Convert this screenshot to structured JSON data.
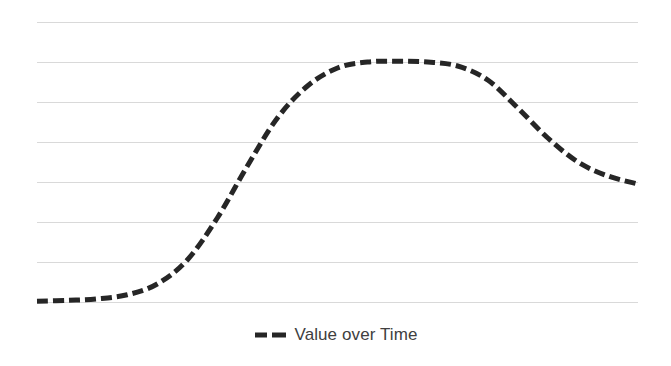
{
  "chart_data": {
    "type": "line",
    "title": "",
    "subtitle": "",
    "xlabel": "",
    "ylabel": "",
    "grid": true,
    "grid_axis": "y",
    "gridline_count": 8,
    "legend_position": "bottom-center",
    "xlim": [
      0,
      20
    ],
    "ylim": [
      0,
      7
    ],
    "x_tick_labels": [],
    "y_tick_labels": [],
    "y_gridline_values": [
      7,
      6,
      5,
      4,
      3,
      2,
      1,
      0
    ],
    "series": [
      {
        "name": "Value over Time",
        "color": "#262626",
        "line_style": "dashed",
        "line_width": 5,
        "x": [
          0,
          1,
          2,
          3,
          4,
          5,
          6,
          7,
          8,
          9,
          10,
          11,
          12,
          13,
          14,
          15,
          16,
          17,
          18,
          19,
          20
        ],
        "values": [
          0.02,
          0.04,
          0.08,
          0.18,
          0.45,
          1.05,
          2.1,
          3.4,
          4.6,
          5.4,
          5.85,
          6.0,
          6.02,
          6.0,
          5.9,
          5.55,
          4.85,
          4.1,
          3.5,
          3.15,
          2.95
        ]
      }
    ],
    "annotations": []
  },
  "legend": {
    "entries": [
      {
        "label": "Value over Time",
        "marker": "dashed-line-marker",
        "color": "#262626"
      }
    ]
  },
  "colors": {
    "background": "#ffffff",
    "gridline": "#d9d9d9",
    "series_line": "#262626",
    "legend_text": "#404040"
  }
}
